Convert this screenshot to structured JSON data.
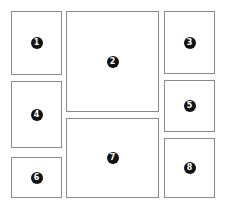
{
  "diagram": {
    "title": "",
    "panels": [
      {
        "id": "1",
        "label": "1",
        "x": 11,
        "y": 11,
        "w": 51,
        "h": 64
      },
      {
        "id": "2",
        "label": "2",
        "x": 66,
        "y": 11,
        "w": 93,
        "h": 101
      },
      {
        "id": "3",
        "label": "3",
        "x": 164,
        "y": 11,
        "w": 51,
        "h": 63
      },
      {
        "id": "4",
        "label": "4",
        "x": 11,
        "y": 81,
        "w": 51,
        "h": 67
      },
      {
        "id": "5",
        "label": "5",
        "x": 164,
        "y": 80,
        "w": 51,
        "h": 52
      },
      {
        "id": "6",
        "label": "6",
        "x": 11,
        "y": 157,
        "w": 51,
        "h": 41
      },
      {
        "id": "7",
        "label": "7",
        "x": 66,
        "y": 118,
        "w": 93,
        "h": 80
      },
      {
        "id": "8",
        "label": "8",
        "x": 164,
        "y": 138,
        "w": 51,
        "h": 60
      }
    ],
    "colors": {
      "border": "#8a8a8a",
      "badge": "#111111",
      "badge_text": "#ffffff",
      "background": "#ffffff"
    }
  }
}
